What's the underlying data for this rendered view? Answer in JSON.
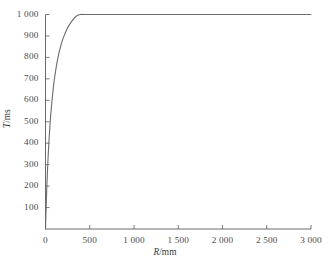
{
  "chart_data": {
    "type": "line",
    "title": "",
    "xlabel": "R/mm",
    "ylabel": "T/ms",
    "xlim": [
      0,
      3000
    ],
    "ylim": [
      0,
      1000
    ],
    "grid": false,
    "legend": null,
    "xticks": [
      0,
      500,
      1000,
      1500,
      2000,
      2500,
      3000
    ],
    "xtick_labels": [
      "0",
      "500",
      "1 000",
      "1 500",
      "2 000",
      "2 500",
      "3 000"
    ],
    "yticks": [
      100,
      200,
      300,
      400,
      500,
      600,
      700,
      800,
      900,
      1000
    ],
    "ytick_labels": [
      "100",
      "200",
      "300",
      "400",
      "500",
      "600",
      "700",
      "800",
      "900",
      "1 000"
    ],
    "series": [
      {
        "name": "T(R)",
        "color": "#6b6b6b",
        "x": [
          0,
          10,
          20,
          30,
          40,
          50,
          60,
          70,
          80,
          90,
          100,
          125,
          150,
          175,
          200,
          250,
          300,
          350,
          400,
          450,
          500,
          600,
          700,
          800,
          900,
          1000,
          1200,
          1400,
          1600,
          1800,
          2000,
          2200,
          2400,
          2600,
          2800,
          3000
        ],
        "y": [
          0,
          138,
          249,
          340,
          416,
          481,
          536,
          584,
          626,
          664,
          697,
          764,
          816,
          857,
          890,
          938,
          970,
          993,
          1010,
          1023,
          1033,
          1048,
          1057,
          1064,
          1069,
          1073,
          1079,
          1083,
          1086,
          1088,
          1089,
          1091,
          1092,
          1093,
          1093,
          1094
        ]
      }
    ],
    "curve_note": "Saturating curve rising steeply from origin, T approaches about 965 ms at R = 3000 mm"
  },
  "axes": {
    "x_axis_name": "x-axis",
    "y_axis_name": "y-axis"
  },
  "figure": {
    "caption": "",
    "axis_color": "#5a5a5a",
    "curve_color": "#6b6b6b",
    "background": "#ffffff"
  }
}
